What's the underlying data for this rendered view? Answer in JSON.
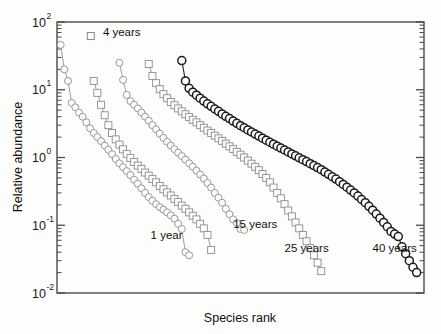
{
  "chart_data": {
    "type": "scatter",
    "title": "",
    "xlabel": "Species rank",
    "ylabel": "Relative abundance",
    "xlim": [
      0,
      100
    ],
    "ylim": [
      0.01,
      100
    ],
    "yscale": "log",
    "xscale": "linear",
    "grid": false,
    "legend_position": "inline-annotations",
    "y_tick_labels": [
      "10",
      "10",
      "10",
      "10",
      "10"
    ],
    "y_tick_exponents": [
      "2",
      "1",
      "0",
      "-1",
      "-2"
    ],
    "y_tick_values": [
      100,
      10,
      1,
      0.1,
      0.01
    ],
    "x_tick_labels": [],
    "series": [
      {
        "name": "1 year",
        "marker": "circle",
        "marker_style": "light",
        "label": "1 year",
        "label_x": 25.5,
        "label_y": 0.062,
        "x": [
          1,
          2,
          3,
          4,
          5,
          6,
          7,
          8,
          9,
          10,
          11,
          12,
          13,
          14,
          15,
          16,
          17,
          18,
          19,
          20,
          21,
          22,
          23,
          24,
          25,
          26,
          27,
          28,
          29,
          30,
          31,
          32,
          33,
          34,
          35,
          36
        ],
        "y": [
          46,
          20,
          13.5,
          6.4,
          5.5,
          4.6,
          4.0,
          3.3,
          2.7,
          2.3,
          2.0,
          1.75,
          1.5,
          1.3,
          1.12,
          0.95,
          0.82,
          0.72,
          0.63,
          0.55,
          0.47,
          0.41,
          0.35,
          0.3,
          0.26,
          0.23,
          0.205,
          0.185,
          0.17,
          0.155,
          0.14,
          0.125,
          0.105,
          0.088,
          0.04,
          0.036
        ]
      },
      {
        "name": "4 years",
        "marker": "square",
        "marker_style": "light",
        "label": "4 years",
        "label_x": 12.5,
        "label_y": 62,
        "legend_marker_x": 9.2,
        "legend_marker_y": 62,
        "x": [
          10,
          11,
          12,
          13,
          14,
          15,
          16,
          17,
          18,
          19,
          20,
          21,
          22,
          23,
          24,
          25,
          26,
          27,
          28,
          29,
          30,
          31,
          32,
          33,
          34,
          35,
          36,
          37,
          38,
          39,
          40,
          41,
          42
        ],
        "y": [
          13.5,
          9.0,
          6.0,
          4.2,
          3.0,
          2.3,
          1.85,
          1.55,
          1.32,
          1.13,
          0.98,
          0.86,
          0.76,
          0.68,
          0.6,
          0.54,
          0.48,
          0.43,
          0.38,
          0.34,
          0.305,
          0.275,
          0.245,
          0.22,
          0.195,
          0.175,
          0.155,
          0.138,
          0.122,
          0.105,
          0.09,
          0.072,
          0.043
        ]
      },
      {
        "name": "15 years",
        "marker": "circle",
        "marker_style": "light",
        "label": "15 years",
        "label_x": 48,
        "label_y": 0.092,
        "x": [
          17,
          18,
          19,
          20,
          21,
          22,
          23,
          24,
          25,
          26,
          27,
          28,
          29,
          30,
          31,
          32,
          33,
          34,
          35,
          36,
          37,
          38,
          39,
          40,
          41,
          42,
          43,
          44,
          45,
          46,
          47,
          48,
          49,
          50,
          51
        ],
        "y": [
          25,
          14,
          8.4,
          6.8,
          6.0,
          5.3,
          4.6,
          4.0,
          3.5,
          3.0,
          2.6,
          2.25,
          1.95,
          1.7,
          1.5,
          1.33,
          1.18,
          1.05,
          0.93,
          0.82,
          0.73,
          0.64,
          0.56,
          0.49,
          0.42,
          0.36,
          0.3,
          0.255,
          0.215,
          0.175,
          0.145,
          0.122,
          0.108,
          0.088,
          0.085
        ]
      },
      {
        "name": "25 years",
        "marker": "square",
        "marker_style": "light",
        "label": "25 years",
        "label_x": 62,
        "label_y": 0.04,
        "x": [
          25,
          26,
          27,
          28,
          29,
          30,
          31,
          32,
          33,
          34,
          35,
          36,
          37,
          38,
          39,
          40,
          41,
          42,
          43,
          44,
          45,
          46,
          47,
          48,
          49,
          50,
          51,
          52,
          53,
          54,
          55,
          56,
          57,
          58,
          59,
          60,
          61,
          62,
          63,
          64,
          65,
          66,
          67,
          68,
          69,
          70,
          71,
          72
        ],
        "y": [
          24,
          16,
          12.5,
          10.2,
          8.6,
          7.5,
          6.6,
          5.9,
          5.3,
          4.8,
          4.35,
          3.95,
          3.6,
          3.3,
          3.0,
          2.75,
          2.5,
          2.3,
          2.1,
          1.92,
          1.76,
          1.6,
          1.46,
          1.33,
          1.21,
          1.1,
          1.0,
          0.9,
          0.81,
          0.73,
          0.65,
          0.57,
          0.5,
          0.43,
          0.36,
          0.3,
          0.25,
          0.205,
          0.165,
          0.135,
          0.11,
          0.09,
          0.072,
          0.058,
          0.046,
          0.036,
          0.028,
          0.021
        ]
      },
      {
        "name": "40 years",
        "marker": "circle",
        "marker_style": "bold",
        "label": "40 years",
        "label_x": 86,
        "label_y": 0.04,
        "x": [
          34,
          35,
          36,
          37,
          38,
          39,
          40,
          41,
          42,
          43,
          44,
          45,
          46,
          47,
          48,
          49,
          50,
          51,
          52,
          53,
          54,
          55,
          56,
          57,
          58,
          59,
          60,
          61,
          62,
          63,
          64,
          65,
          66,
          67,
          68,
          69,
          70,
          71,
          72,
          73,
          74,
          75,
          76,
          77,
          78,
          79,
          80,
          81,
          82,
          83,
          84,
          85,
          86,
          87,
          88,
          89,
          90,
          91,
          92,
          93,
          94,
          95,
          96,
          97,
          98
        ],
        "y": [
          27,
          13.5,
          10.5,
          9.2,
          8.3,
          7.5,
          6.8,
          6.2,
          5.7,
          5.2,
          4.8,
          4.4,
          4.05,
          3.75,
          3.45,
          3.2,
          2.95,
          2.75,
          2.55,
          2.38,
          2.22,
          2.07,
          1.93,
          1.8,
          1.68,
          1.57,
          1.47,
          1.38,
          1.29,
          1.21,
          1.13,
          1.06,
          0.99,
          0.93,
          0.87,
          0.81,
          0.76,
          0.71,
          0.66,
          0.61,
          0.565,
          0.52,
          0.48,
          0.44,
          0.4,
          0.365,
          0.33,
          0.3,
          0.27,
          0.24,
          0.215,
          0.19,
          0.167,
          0.146,
          0.127,
          0.11,
          0.095,
          0.081,
          0.074,
          0.068,
          0.048,
          0.038,
          0.03,
          0.024,
          0.02
        ]
      }
    ]
  },
  "axes": {
    "y_label": "Relative abundance",
    "x_label": "Species rank",
    "y_tick_base": "10"
  },
  "colors": {
    "frame": "#4a4a48",
    "light_marker": "#8d8d8a",
    "bold_marker": "#1b1b1b",
    "background": "#fdfdfb",
    "text": "#111111"
  }
}
